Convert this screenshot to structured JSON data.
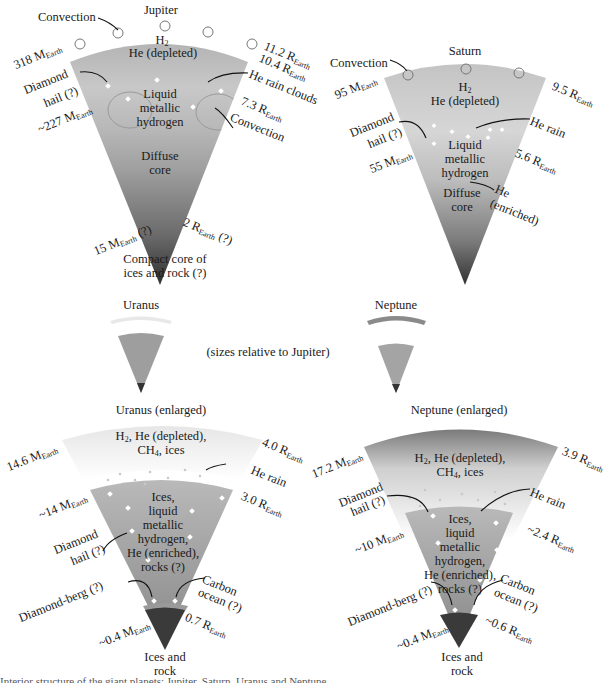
{
  "figure": {
    "jupiter": {
      "title": "Jupiter",
      "convection_top": "Convection",
      "layer1": [
        "H2",
        "He (depleted)"
      ],
      "layer2": [
        "Liquid",
        "metallic",
        "hydrogen"
      ],
      "layer3": [
        "Diffuse",
        "core"
      ],
      "core_label": [
        "Compact core of",
        "ices and rock (?)"
      ],
      "mass_outer": "318 M",
      "mass_mid": "~227 M",
      "mass_core": "15 M",
      "mass_core_suffix": "(?)",
      "radius_outer": "11.2 R",
      "radius_cloud": "10.4 R",
      "radius_mid": "7.3 R",
      "radius_core": "2 R",
      "radius_core_suffix": "(?)",
      "diamond_hail": [
        "Diamond",
        "hail (?)"
      ],
      "he_rain_clouds": "He rain clouds",
      "convection_inner": "Convection"
    },
    "saturn": {
      "title": "Saturn",
      "convection_top": "Convection",
      "layer1": [
        "H2",
        "He (depleted)"
      ],
      "layer2": [
        "Liquid",
        "metallic",
        "hydrogen"
      ],
      "layer3": [
        "Diffuse",
        "core"
      ],
      "mass_outer": "95 M",
      "mass_mid": "55 M",
      "radius_outer": "9.5 R",
      "radius_mid": "5.6 R",
      "diamond_hail": [
        "Diamond",
        "hail (?)"
      ],
      "he_rain": "He rain",
      "he_enriched": [
        "He",
        "(enriched)"
      ]
    },
    "scale": {
      "uranus_small": "Uranus",
      "neptune_small": "Neptune",
      "note": "(sizes relative to Jupiter)"
    },
    "uranus": {
      "title": "Uranus (enlarged)",
      "layer1": [
        "H2, He (depleted),",
        "CH4, ices"
      ],
      "layer2": [
        "Ices,",
        "liquid",
        "metallic",
        "hydrogen,",
        "He (enriched),",
        "rocks (?)"
      ],
      "core_label": [
        "Ices and",
        "rock"
      ],
      "mass_outer": "14.6 M",
      "mass_mid": "~14 M",
      "mass_core": "~0.4 M",
      "radius_outer": "4.0 R",
      "radius_mid": "3.0 R",
      "radius_core": "0.7 R",
      "he_rain": "He rain",
      "diamond_hail": [
        "Diamond",
        "hail (?)"
      ],
      "diamond_berg": "Diamond-berg (?)",
      "carbon_ocean": [
        "Carbon",
        "ocean (?)"
      ]
    },
    "neptune": {
      "title": "Neptune (enlarged)",
      "layer1": [
        "H2, He (depleted),",
        "CH4, ices"
      ],
      "layer2": [
        "Ices,",
        "liquid",
        "metallic",
        "hydrogen,",
        "He (enriched),",
        "rocks (?)"
      ],
      "core_label": [
        "Ices and",
        "rock"
      ],
      "mass_outer": "17.2 M",
      "mass_mid": "~10 M",
      "mass_core": "~0.4 M",
      "radius_outer": "3.9 R",
      "radius_mid": "~2.4 R",
      "radius_core": "~0.6 R",
      "he_rain": "He rain",
      "diamond_hail": [
        "Diamond",
        "hail (?)"
      ],
      "diamond_berg": "Diamond-berg (?)",
      "carbon_ocean": [
        "Carbon",
        "ocean (?)"
      ]
    },
    "subscript_earth": "Earth",
    "caption_fragment": "Interior structure of the giant planets: Jupiter, Saturn, Uranus and Neptune"
  }
}
